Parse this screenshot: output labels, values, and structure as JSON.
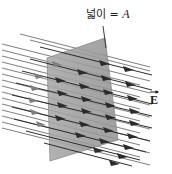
{
  "figure": {
    "name": "electric-flux-through-surface",
    "caption_labels": {
      "area_label_text": "넓이 = ",
      "area_label_symbol": "A",
      "field_label_symbol": "E"
    },
    "colors": {
      "background": "#ffffff",
      "plane_fill": "#9b9b9b",
      "plane_fill_light": "#b4b4b4",
      "plane_stroke": "#8a8a8a",
      "field_line": "#2b2b2b",
      "field_line_faint": "#6f6f6f",
      "label_text": "#1a1a1a",
      "leader_line": "#2b2b2b"
    },
    "geometry": {
      "width": 172,
      "height": 174,
      "plane_vertices": "105,38 118,140 50,161 47,58",
      "leader_line": "103,26 104,45",
      "field_direction_deg": 14,
      "field_line_rows": 9,
      "field_line_columns": 5
    },
    "field_lines": {
      "rows_y_start": [
        47,
        59,
        71,
        83,
        95,
        107,
        119,
        131,
        143
      ],
      "x_start": 2,
      "x_end": 146,
      "arrowhead_x_positions": [
        58,
        80,
        103,
        126
      ],
      "arrowhead_length": 11,
      "arrowhead_width": 5
    }
  }
}
